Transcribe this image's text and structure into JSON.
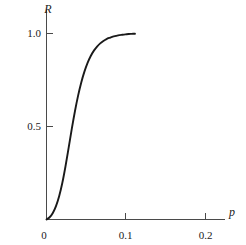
{
  "figure": {
    "background_color": "#ffffff",
    "curve_color": "#1a1a1a",
    "axis_color": "#4a4a4a",
    "text_color": "#1a1a1a"
  },
  "chart_data": {
    "type": "line",
    "title": "",
    "subtitle": "",
    "xlabel": "p",
    "ylabel": "R",
    "xlim": [
      0,
      0.227
    ],
    "ylim": [
      0,
      1.16
    ],
    "grid": false,
    "legend": null,
    "annotations": [],
    "x_ticks": [
      {
        "value": 0,
        "label": "0"
      },
      {
        "value": 0.1,
        "label": "0.1"
      },
      {
        "value": 0.2,
        "label": "0.2"
      }
    ],
    "y_ticks": [
      {
        "value": 0.5,
        "label": "0.5"
      },
      {
        "value": 1.0,
        "label": "1.0"
      }
    ],
    "origin_label": "0",
    "series": [
      {
        "name": "R(p)",
        "color": "#1a1a1a",
        "x": [
          0.0,
          0.004,
          0.008,
          0.012,
          0.016,
          0.02,
          0.024,
          0.028,
          0.032,
          0.036,
          0.04,
          0.044,
          0.048,
          0.052,
          0.056,
          0.06,
          0.064,
          0.068,
          0.072,
          0.076,
          0.08,
          0.084,
          0.088,
          0.092,
          0.096,
          0.1,
          0.104,
          0.108,
          0.112
        ],
        "y": [
          0.0,
          0.012,
          0.035,
          0.072,
          0.125,
          0.196,
          0.285,
          0.385,
          0.487,
          0.582,
          0.666,
          0.737,
          0.795,
          0.842,
          0.879,
          0.908,
          0.93,
          0.947,
          0.96,
          0.97,
          0.977,
          0.983,
          0.987,
          0.991,
          0.993,
          0.995,
          0.997,
          0.998,
          0.999
        ]
      }
    ]
  },
  "labels": {
    "y_axis_title": "R",
    "x_axis_title": "p",
    "y_tick_1": "1.0",
    "y_tick_05": "0.5",
    "x_tick_01": "0.1",
    "x_tick_02": "0.2",
    "origin": "0"
  }
}
